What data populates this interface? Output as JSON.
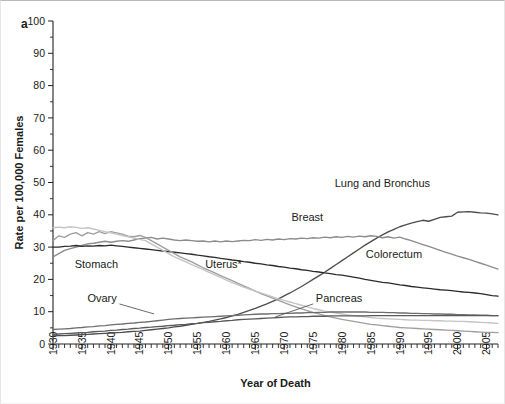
{
  "panel": {
    "label": "a"
  },
  "axes": {
    "y_title": "Rate per 100,000 Females",
    "x_title": "Year of Death",
    "y_ticks": [
      "0",
      "10",
      "20",
      "30",
      "40",
      "50",
      "60",
      "70",
      "80",
      "90",
      "100"
    ],
    "x_ticks": [
      "1930",
      "1935",
      "1940",
      "1945",
      "1950",
      "1955",
      "1960",
      "1965",
      "1970",
      "1975",
      "1980",
      "1985",
      "1990",
      "1995",
      "2000",
      "2005"
    ]
  },
  "colors": {
    "lung": "#4d4d4d",
    "breast": "#8c8c8c",
    "colorectum": "#2b2b2b",
    "stomach": "#9e9e9e",
    "uterus": "#c4c4c4",
    "ovary": "#6e6e6e",
    "pancreas": "#5a5a5a",
    "axis": "#222222",
    "text": "#1a1a1a"
  },
  "chart_data": {
    "type": "line",
    "title": "",
    "xlabel": "Year of Death",
    "ylabel": "Rate per 100,000 Females",
    "xlim": [
      1930,
      2007
    ],
    "ylim": [
      0,
      100
    ],
    "grid": false,
    "legend": "inline-labels",
    "x": [
      1930,
      1931,
      1932,
      1933,
      1934,
      1935,
      1936,
      1937,
      1938,
      1939,
      1940,
      1941,
      1942,
      1943,
      1944,
      1945,
      1946,
      1947,
      1948,
      1949,
      1950,
      1951,
      1952,
      1953,
      1954,
      1955,
      1956,
      1957,
      1958,
      1959,
      1960,
      1961,
      1962,
      1963,
      1964,
      1965,
      1966,
      1967,
      1968,
      1969,
      1970,
      1971,
      1972,
      1973,
      1974,
      1975,
      1976,
      1977,
      1978,
      1979,
      1980,
      1981,
      1982,
      1983,
      1984,
      1985,
      1986,
      1987,
      1988,
      1989,
      1990,
      1991,
      1992,
      1993,
      1994,
      1995,
      1996,
      1997,
      1998,
      1999,
      2000,
      2001,
      2002,
      2003,
      2004,
      2005,
      2006,
      2007
    ],
    "series": [
      {
        "name": "Lung and Bronchus",
        "label": "Lung and Bronchus",
        "color": "#4d4d4d",
        "values": [
          2.5,
          2.6,
          2.6,
          2.7,
          2.8,
          2.9,
          3.0,
          3.1,
          3.2,
          3.3,
          3.4,
          3.5,
          3.6,
          3.8,
          3.9,
          4.0,
          4.2,
          4.4,
          4.6,
          4.8,
          5.0,
          5.3,
          5.5,
          5.8,
          6.1,
          6.4,
          6.7,
          7.0,
          7.4,
          7.8,
          8.2,
          8.7,
          9.2,
          9.8,
          10.4,
          11.0,
          11.7,
          12.4,
          13.2,
          14.0,
          14.9,
          15.8,
          16.8,
          17.8,
          18.9,
          20.0,
          21.1,
          22.2,
          23.4,
          24.6,
          25.8,
          27.0,
          28.2,
          29.4,
          30.6,
          31.7,
          32.8,
          33.8,
          34.7,
          35.5,
          36.3,
          36.9,
          37.4,
          37.9,
          38.3,
          38.0,
          38.6,
          39.2,
          39.4,
          39.6,
          40.8,
          40.9,
          41.0,
          40.8,
          40.6,
          40.5,
          40.3,
          40.0
        ]
      },
      {
        "name": "Breast",
        "label": "Breast",
        "color": "#8c8c8c",
        "values": [
          27.0,
          28.0,
          29.0,
          29.5,
          30.0,
          30.5,
          31.0,
          31.2,
          31.5,
          31.8,
          31.5,
          31.8,
          32.0,
          31.8,
          32.2,
          32.6,
          32.8,
          33.0,
          32.5,
          32.8,
          32.5,
          32.2,
          32.0,
          32.2,
          32.0,
          31.8,
          31.9,
          31.6,
          31.9,
          31.6,
          31.9,
          31.7,
          31.9,
          32.1,
          32.0,
          32.3,
          32.1,
          32.4,
          32.2,
          32.5,
          32.3,
          32.6,
          32.5,
          32.8,
          32.6,
          32.9,
          32.8,
          33.1,
          32.9,
          33.2,
          33.0,
          33.3,
          33.1,
          33.4,
          33.2,
          33.5,
          33.3,
          32.9,
          33.2,
          32.8,
          33.1,
          32.5,
          32.0,
          31.4,
          30.8,
          30.2,
          29.6,
          29.0,
          28.4,
          27.8,
          27.2,
          26.7,
          26.2,
          25.6,
          25.0,
          24.4,
          23.8,
          23.2
        ]
      },
      {
        "name": "Colorectum",
        "label": "Colorectum",
        "color": "#2b2b2b",
        "values": [
          30.0,
          30.0,
          30.2,
          30.3,
          30.5,
          30.2,
          30.4,
          30.3,
          30.5,
          30.4,
          30.6,
          30.4,
          30.2,
          30.0,
          29.8,
          29.6,
          29.4,
          29.2,
          29.0,
          28.8,
          28.6,
          28.4,
          28.2,
          28.0,
          27.8,
          27.5,
          27.3,
          27.0,
          26.8,
          26.5,
          26.3,
          26.0,
          25.8,
          25.5,
          25.3,
          25.0,
          24.8,
          24.5,
          24.3,
          24.0,
          23.8,
          23.5,
          23.3,
          23.0,
          22.8,
          22.5,
          22.3,
          22.0,
          21.8,
          21.5,
          21.3,
          21.0,
          20.7,
          20.4,
          20.0,
          19.7,
          19.4,
          19.1,
          18.9,
          18.6,
          18.3,
          18.1,
          17.8,
          17.6,
          17.4,
          17.2,
          17.0,
          16.8,
          16.7,
          16.5,
          16.3,
          16.1,
          16.0,
          15.8,
          15.6,
          15.3,
          15.0,
          14.8
        ]
      },
      {
        "name": "Stomach",
        "label": "Stomach",
        "color": "#9e9e9e",
        "values": [
          32.0,
          33.5,
          33.0,
          34.0,
          34.5,
          33.5,
          34.5,
          34.0,
          34.8,
          34.2,
          34.8,
          34.4,
          34.0,
          33.4,
          33.2,
          33.6,
          33.0,
          32.0,
          31.0,
          30.0,
          29.0,
          28.0,
          27.0,
          26.2,
          25.4,
          24.5,
          23.6,
          22.8,
          22.0,
          21.2,
          20.4,
          19.6,
          18.8,
          18.0,
          17.2,
          16.4,
          15.6,
          14.9,
          14.2,
          13.5,
          12.8,
          12.1,
          11.5,
          10.9,
          10.3,
          9.8,
          9.3,
          8.8,
          8.4,
          8.0,
          7.6,
          7.3,
          7.0,
          6.7,
          6.4,
          6.1,
          5.9,
          5.7,
          5.5,
          5.3,
          5.1,
          5.0,
          4.9,
          4.8,
          4.7,
          4.6,
          4.5,
          4.4,
          4.3,
          4.2,
          4.1,
          4.0,
          3.9,
          3.8,
          3.7,
          3.6,
          3.6,
          3.5
        ]
      },
      {
        "name": "Uterus",
        "label": "Uterus*",
        "color": "#c4c4c4",
        "values": [
          36.0,
          36.2,
          36.0,
          36.3,
          36.1,
          35.8,
          36.0,
          35.6,
          35.2,
          34.8,
          34.4,
          34.0,
          33.6,
          33.2,
          32.8,
          32.4,
          32.0,
          31.0,
          30.0,
          29.0,
          28.0,
          27.0,
          26.2,
          25.4,
          24.6,
          23.8,
          23.0,
          22.2,
          21.4,
          20.6,
          19.8,
          19.0,
          18.3,
          17.6,
          17.0,
          16.4,
          15.8,
          15.2,
          14.6,
          14.0,
          13.5,
          13.0,
          12.5,
          12.0,
          11.5,
          11.0,
          10.6,
          10.2,
          9.9,
          9.6,
          9.3,
          9.0,
          8.8,
          8.6,
          8.4,
          8.2,
          8.0,
          7.9,
          7.8,
          7.7,
          7.6,
          7.5,
          7.4,
          7.4,
          7.3,
          7.3,
          7.2,
          7.2,
          7.1,
          7.1,
          7.0,
          7.0,
          6.9,
          6.8,
          6.7,
          6.6,
          6.5,
          6.4
        ]
      },
      {
        "name": "Ovary",
        "label": "Ovary",
        "color": "#6e6e6e",
        "values": [
          4.5,
          4.6,
          4.7,
          4.8,
          5.0,
          5.1,
          5.3,
          5.4,
          5.6,
          5.7,
          5.9,
          6.1,
          6.2,
          6.4,
          6.5,
          6.7,
          6.8,
          7.0,
          7.2,
          7.4,
          7.6,
          7.8,
          7.9,
          8.0,
          8.1,
          8.2,
          8.3,
          8.4,
          8.5,
          8.6,
          8.7,
          8.8,
          8.9,
          9.0,
          9.1,
          9.2,
          9.3,
          9.3,
          9.4,
          9.4,
          9.5,
          9.5,
          9.6,
          9.6,
          9.7,
          9.7,
          9.8,
          9.8,
          9.9,
          9.9,
          9.9,
          9.9,
          9.9,
          9.9,
          9.9,
          9.8,
          9.8,
          9.8,
          9.7,
          9.7,
          9.6,
          9.6,
          9.5,
          9.5,
          9.4,
          9.4,
          9.3,
          9.3,
          9.2,
          9.2,
          9.1,
          9.1,
          9.0,
          9.0,
          8.9,
          8.9,
          8.8,
          8.8
        ]
      },
      {
        "name": "Pancreas",
        "label": "Pancreas",
        "color": "#5a5a5a",
        "values": [
          3.0,
          3.1,
          3.2,
          3.3,
          3.4,
          3.5,
          3.6,
          3.8,
          3.9,
          4.0,
          4.2,
          4.3,
          4.5,
          4.6,
          4.8,
          4.9,
          5.1,
          5.2,
          5.4,
          5.5,
          5.7,
          5.8,
          6.0,
          6.1,
          6.3,
          6.4,
          6.6,
          6.7,
          6.9,
          7.0,
          7.2,
          7.3,
          7.5,
          7.6,
          7.7,
          7.8,
          7.9,
          8.0,
          8.1,
          8.2,
          8.3,
          8.4,
          8.4,
          8.5,
          8.5,
          8.6,
          8.6,
          8.6,
          8.7,
          8.7,
          8.7,
          8.7,
          8.7,
          8.7,
          8.7,
          8.8,
          8.8,
          8.8,
          8.8,
          8.8,
          8.8,
          8.8,
          8.8,
          8.8,
          8.8,
          8.8,
          8.8,
          8.8,
          8.8,
          8.8,
          8.8,
          8.8,
          8.8,
          8.8,
          8.8,
          8.8,
          8.8,
          8.8
        ]
      }
    ],
    "annotations": [
      {
        "name": "lung-label",
        "text": "Lung and Bronchus",
        "x": 1987,
        "y": 48.5,
        "anchor": "middle",
        "leader": false
      },
      {
        "name": "breast-label",
        "text": "Breast",
        "x": 1974,
        "y": 38.0,
        "anchor": "middle",
        "leader": false
      },
      {
        "name": "colorectum-label",
        "text": "Colorectum",
        "x": 1989,
        "y": 26.5,
        "anchor": "middle",
        "leader": false
      },
      {
        "name": "stomach-label",
        "text": "Stomach",
        "x": 1937.5,
        "y": 23.5,
        "anchor": "middle",
        "leader": false
      },
      {
        "name": "uterus-label",
        "text": "Uterus*",
        "x": 1959.5,
        "y": 23.5,
        "anchor": "middle",
        "leader": false
      },
      {
        "name": "ovary-label",
        "text": "Ovary",
        "x": 1938.5,
        "y": 13.0,
        "anchor": "middle",
        "leader": true,
        "lx1": 1941.5,
        "ly1": 12.4,
        "lx2": 1947.5,
        "ly2": 9.3
      },
      {
        "name": "pancreas-label",
        "text": "Pancreas",
        "x": 1979.5,
        "y": 13.0,
        "anchor": "middle",
        "leader": true,
        "lx1": 1975.0,
        "ly1": 12.4,
        "lx2": 1968.5,
        "ly2": 8.4
      }
    ]
  }
}
